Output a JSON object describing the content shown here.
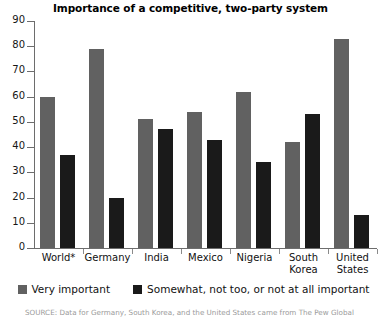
{
  "chart_data": {
    "type": "bar",
    "title": "Importance of a competitive, two-party system",
    "xlabel": "",
    "ylabel": "",
    "ylim": [
      0,
      90
    ],
    "yticks": [
      0,
      10,
      20,
      30,
      40,
      50,
      60,
      70,
      80,
      90
    ],
    "grid": false,
    "legend_position": "bottom",
    "categories": [
      "World*",
      "Germany",
      "India",
      "Mexico",
      "Nigeria",
      "South Korea",
      "United States"
    ],
    "series": [
      {
        "name": "Very important",
        "color": "#616161",
        "values": [
          60,
          79,
          51,
          54,
          62,
          42,
          83
        ]
      },
      {
        "name": "Somewhat, not too, or not at all important",
        "color": "#1a1a1a",
        "values": [
          37,
          20,
          47,
          43,
          34,
          53,
          13
        ]
      }
    ],
    "source": "SOURCE: Data for Germany, South Korea, and the United States came from The Pew Global"
  },
  "legend": {
    "items": [
      {
        "label": "Very important",
        "color": "#616161"
      },
      {
        "label": "Somewhat, not too, or not at all important",
        "color": "#1a1a1a"
      }
    ]
  }
}
